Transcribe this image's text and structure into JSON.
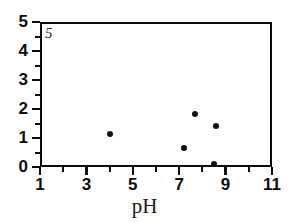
{
  "chart_data": {
    "type": "scatter",
    "title": "",
    "panel_label": "5",
    "xlabel": "pH",
    "ylabel": "",
    "xlim": [
      1,
      11
    ],
    "ylim": [
      0,
      5
    ],
    "grid": false,
    "legend": null,
    "x_major_ticks": [
      "1",
      "3",
      "5",
      "7",
      "9",
      "11"
    ],
    "x_major_values": [
      1,
      3,
      5,
      7,
      9,
      11
    ],
    "x_minor_values": [
      2,
      4,
      6,
      8,
      10
    ],
    "y_major_ticks": [
      "0",
      "1",
      "2",
      "3",
      "4",
      "5"
    ],
    "y_major_values": [
      0,
      1,
      2,
      3,
      4,
      5
    ],
    "y_minor_values": [
      0.5,
      1.5,
      2.5,
      3.5,
      4.5
    ],
    "marker": "filled-circle",
    "marker_color": "#111111",
    "points": [
      {
        "x": 4.0,
        "y": 1.14
      },
      {
        "x": 7.2,
        "y": 0.66
      },
      {
        "x": 7.7,
        "y": 1.83
      },
      {
        "x": 8.6,
        "y": 1.41
      },
      {
        "x": 8.5,
        "y": 0.1
      }
    ]
  },
  "figure": {
    "background": "#ffffff",
    "frame_color": "#0d0d0d"
  }
}
